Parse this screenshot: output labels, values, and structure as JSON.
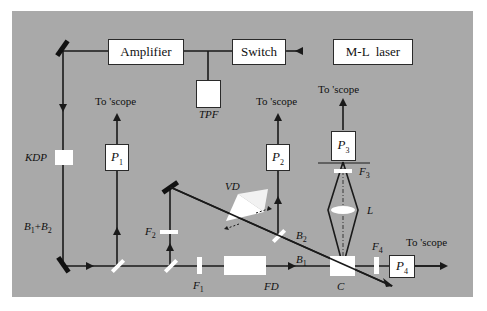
{
  "diagram": {
    "title": "",
    "colors": {
      "panel": "#a9a9a9",
      "component": "#ffffff",
      "beam": "#1a1a1a"
    },
    "components": {
      "amplifier": "Amplifier",
      "switch": "Switch",
      "laser": "M-L  laser",
      "tpf": "TPF",
      "kdp": "KDP",
      "p1": "P",
      "p1_sub": "1",
      "p2": "P",
      "p2_sub": "2",
      "p3": "P",
      "p3_sub": "3",
      "p4": "P",
      "p4_sub": "4",
      "vd": "VD",
      "fd": "FD",
      "crystal": "C",
      "lens": "L"
    },
    "filters": {
      "f1": "F",
      "f1_sub": "1",
      "f2": "F",
      "f2_sub": "2",
      "f3": "F",
      "f3_sub": "3",
      "f4": "F",
      "f4_sub": "4"
    },
    "beams": {
      "b1": "B",
      "b1_sub": "1",
      "b2": "B",
      "b2_sub": "2",
      "b12_a": "B",
      "b12_a_sub": "1",
      "b12_plus": "+",
      "b12_b": "B",
      "b12_b_sub": "2"
    },
    "scope_labels": {
      "p1": "To 'scope",
      "p2": "To 'scope",
      "p3": "To 'scope",
      "p4": "To 'scope"
    }
  }
}
